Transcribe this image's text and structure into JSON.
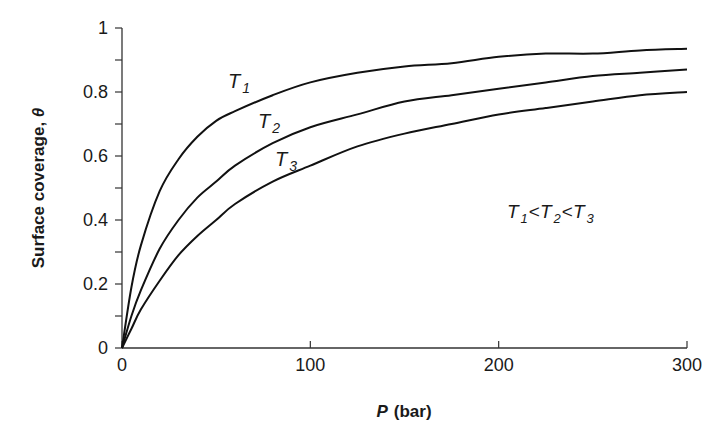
{
  "chart_data": {
    "type": "line",
    "title": "",
    "xlabel": "P (bar)",
    "xlabel_var": "P",
    "xlabel_unit": "(bar)",
    "ylabel": "Surface coverage, θ",
    "ylabel_text": "Surface coverage, ",
    "ylabel_var": "θ",
    "xlim": [
      0,
      300
    ],
    "ylim": [
      0,
      1
    ],
    "x_ticks": [
      0,
      100,
      200,
      300
    ],
    "x_tick_labels": [
      "0",
      "100",
      "200",
      "300"
    ],
    "y_ticks": [
      0,
      0.2,
      0.4,
      0.6,
      0.8,
      1
    ],
    "y_tick_labels": [
      "0",
      "0.2",
      "0.4",
      "0.6",
      "0.8",
      "1"
    ],
    "y_minor_step": 0.1,
    "grid": false,
    "x": [
      0,
      5,
      10,
      20,
      30,
      40,
      50,
      60,
      80,
      100,
      125,
      150,
      175,
      200,
      225,
      250,
      275,
      300
    ],
    "series": [
      {
        "name": "T1",
        "label_main": "T",
        "label_sub": "1",
        "values": [
          0,
          0.19,
          0.32,
          0.49,
          0.59,
          0.66,
          0.71,
          0.74,
          0.79,
          0.83,
          0.86,
          0.88,
          0.89,
          0.91,
          0.92,
          0.92,
          0.93,
          0.935
        ]
      },
      {
        "name": "T2",
        "label_main": "T",
        "label_sub": "2",
        "values": [
          0,
          0.1,
          0.18,
          0.31,
          0.4,
          0.47,
          0.52,
          0.57,
          0.64,
          0.69,
          0.73,
          0.77,
          0.79,
          0.81,
          0.83,
          0.85,
          0.86,
          0.87
        ]
      },
      {
        "name": "T3",
        "label_main": "T",
        "label_sub": "3",
        "values": [
          0,
          0.06,
          0.12,
          0.21,
          0.29,
          0.35,
          0.4,
          0.45,
          0.52,
          0.57,
          0.63,
          0.67,
          0.7,
          0.73,
          0.75,
          0.77,
          0.79,
          0.8
        ]
      }
    ],
    "annotations": [
      {
        "text": "T1<T2<T3",
        "parts": [
          [
            "T",
            "1"
          ],
          [
            "T",
            "2"
          ],
          [
            "T",
            "3"
          ]
        ],
        "separator": "<"
      }
    ],
    "legend": "inline curve labels"
  }
}
